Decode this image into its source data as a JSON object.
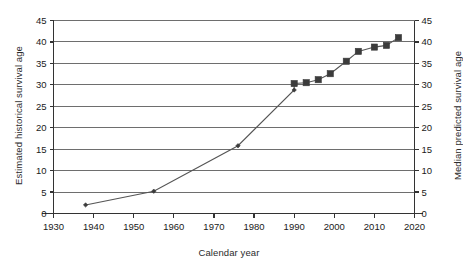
{
  "chart_data": {
    "type": "line",
    "title": "",
    "xlabel": "Calendar year",
    "ylabel": "Estimated historical survival age",
    "ylabel_right": "Median predicted survival age",
    "xlim": [
      1930,
      2020
    ],
    "ylim": [
      0,
      45
    ],
    "xticks": [
      1930,
      1940,
      1950,
      1960,
      1970,
      1980,
      1990,
      2000,
      2010,
      2020
    ],
    "yticks": [
      0,
      5,
      10,
      15,
      20,
      25,
      30,
      35,
      40,
      45
    ],
    "yticks_right": [
      0,
      5,
      10,
      15,
      20,
      25,
      30,
      35,
      40,
      45
    ],
    "grid": true,
    "grid_axis": "y",
    "legend": "none",
    "line_color": "#555555",
    "marker_color": "#3b3b3b",
    "series": [
      {
        "name": "Estimated historical survival age",
        "marker": "diamond",
        "points": [
          {
            "x": 1938,
            "y": 2.0
          },
          {
            "x": 1955,
            "y": 5.2
          },
          {
            "x": 1976,
            "y": 15.8
          },
          {
            "x": 1990,
            "y": 28.8
          }
        ]
      },
      {
        "name": "Median predicted survival age",
        "marker": "square",
        "points": [
          {
            "x": 1990,
            "y": 30.3
          },
          {
            "x": 1993,
            "y": 30.5
          },
          {
            "x": 1996,
            "y": 31.2
          },
          {
            "x": 1999,
            "y": 32.6
          },
          {
            "x": 2003,
            "y": 35.5
          },
          {
            "x": 2006,
            "y": 37.8
          },
          {
            "x": 2010,
            "y": 38.8
          },
          {
            "x": 2013,
            "y": 39.2
          },
          {
            "x": 2016,
            "y": 41.0
          }
        ]
      }
    ]
  },
  "axes": {
    "xlabel": "Calendar year",
    "ylabel_left": "Estimated historical survival age",
    "ylabel_right": "Median predicted survival age"
  }
}
